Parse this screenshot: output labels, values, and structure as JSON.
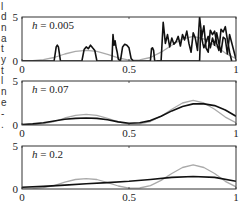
{
  "side_text_fragments": [
    "l",
    "d",
    "n",
    "a",
    "t",
    "y",
    "t",
    "l",
    "n",
    "e",
    "-",
    "."
  ],
  "colors": {
    "estimate": "#111111",
    "true_density": "#aaaaaa",
    "frame": "#333333"
  },
  "chart_data": [
    {
      "type": "line",
      "title": "h = 0.005",
      "annotation": "h = 0.005",
      "xlabel": "",
      "ylabel": "",
      "xlim": [
        0,
        1
      ],
      "ylim": [
        0,
        5
      ],
      "xticks": [
        "0",
        "0.5",
        "1"
      ],
      "yticks": [
        "0",
        "5"
      ],
      "grid": false,
      "series": [
        {
          "name": "true density",
          "color": "#aaaaaa",
          "x": [
            0,
            0.05,
            0.1,
            0.15,
            0.2,
            0.25,
            0.3,
            0.35,
            0.4,
            0.45,
            0.5,
            0.55,
            0.6,
            0.65,
            0.7,
            0.75,
            0.8,
            0.85,
            0.9,
            0.95,
            1.0
          ],
          "y": [
            0.02,
            0.05,
            0.15,
            0.4,
            0.8,
            1.1,
            1.2,
            1.1,
            0.75,
            0.35,
            0.1,
            0.12,
            0.4,
            1.0,
            1.8,
            2.5,
            2.8,
            2.5,
            1.8,
            0.9,
            0.25
          ]
        },
        {
          "name": "kernel estimate",
          "color": "#111111",
          "x": [
            0,
            0.15,
            0.16,
            0.165,
            0.17,
            0.18,
            0.28,
            0.29,
            0.3,
            0.31,
            0.32,
            0.33,
            0.34,
            0.35,
            0.36,
            0.42,
            0.425,
            0.43,
            0.435,
            0.44,
            0.445,
            0.45,
            0.46,
            0.47,
            0.48,
            0.49,
            0.5,
            0.51,
            0.52,
            0.53,
            0.6,
            0.605,
            0.61,
            0.615,
            0.62,
            0.83,
            0.835,
            0.84,
            0.845,
            0.85,
            0.87,
            0.88,
            0.89,
            0.9,
            0.91,
            0.92,
            0.93,
            0.94,
            0.95,
            0.96,
            0.97,
            1.0
          ],
          "y": [
            0,
            0,
            1.6,
            1.8,
            1.6,
            0,
            0,
            1.3,
            1.6,
            1.4,
            1.8,
            1.5,
            1.2,
            0,
            0,
            0,
            3.0,
            1.8,
            2.3,
            1.5,
            1.0,
            0.2,
            0,
            1.6,
            1.9,
            1.8,
            1.5,
            0.3,
            0,
            0,
            0,
            1.4,
            1.5,
            1.2,
            0,
            0,
            3.5,
            2.6,
            2.0,
            1.5,
            2.8,
            1.5,
            2.6,
            1.8,
            3.2,
            2.0,
            1.0,
            2.7,
            2.5,
            0.8,
            3.0,
            0.2
          ]
        },
        {
          "name": "kernel estimate (right)",
          "color": "#111111",
          "x": [
            0.63,
            0.65,
            0.66,
            0.67,
            0.68,
            0.69,
            0.7,
            0.71,
            0.72,
            0.73,
            0.74,
            0.75,
            0.76,
            0.77,
            0.78,
            0.79,
            0.8,
            0.81,
            0.82,
            0.83,
            0.84,
            0.85,
            0.86,
            0.87,
            0.88,
            0.89,
            0.9,
            0.91,
            0.92,
            0.93,
            0.94,
            0.95,
            0.96,
            0.97,
            0.98
          ],
          "y": [
            0,
            0,
            4.4,
            2.0,
            3.0,
            1.6,
            2.6,
            1.9,
            2.2,
            2.8,
            1.7,
            3.0,
            2.4,
            3.4,
            2.0,
            1.0,
            3.2,
            2.6,
            1.2,
            5.0,
            2.8,
            4.0,
            1.5,
            1.0,
            3.5,
            3.0,
            3.4,
            2.0,
            1.2,
            3.6,
            3.3,
            3.9,
            2.4,
            1.0,
            0
          ]
        }
      ]
    },
    {
      "type": "line",
      "title": "h = 0.07",
      "annotation": "h = 0.07",
      "xlabel": "",
      "ylabel": "",
      "xlim": [
        0,
        1
      ],
      "ylim": [
        0,
        5
      ],
      "xticks": [
        "0",
        "0.5",
        "1"
      ],
      "yticks": [
        "0",
        "5"
      ],
      "grid": false,
      "series": [
        {
          "name": "true density",
          "color": "#aaaaaa",
          "x": [
            0,
            0.05,
            0.1,
            0.15,
            0.2,
            0.25,
            0.3,
            0.35,
            0.4,
            0.45,
            0.5,
            0.55,
            0.6,
            0.65,
            0.7,
            0.75,
            0.8,
            0.85,
            0.9,
            0.95,
            1.0
          ],
          "y": [
            0.02,
            0.05,
            0.15,
            0.4,
            0.8,
            1.1,
            1.2,
            1.1,
            0.75,
            0.35,
            0.1,
            0.12,
            0.4,
            1.0,
            1.8,
            2.5,
            2.8,
            2.5,
            1.8,
            0.9,
            0.25
          ]
        },
        {
          "name": "kernel estimate",
          "color": "#111111",
          "x": [
            0,
            0.05,
            0.1,
            0.15,
            0.2,
            0.25,
            0.3,
            0.35,
            0.4,
            0.45,
            0.5,
            0.55,
            0.6,
            0.65,
            0.7,
            0.75,
            0.8,
            0.85,
            0.9,
            0.95,
            1.0
          ],
          "y": [
            0.05,
            0.12,
            0.25,
            0.45,
            0.65,
            0.75,
            0.8,
            0.75,
            0.6,
            0.35,
            0.2,
            0.25,
            0.5,
            1.0,
            1.6,
            2.1,
            2.4,
            2.4,
            2.2,
            1.7,
            1.0
          ]
        }
      ]
    },
    {
      "type": "line",
      "title": "h = 0.2",
      "annotation": "h = 0.2",
      "xlabel": "",
      "ylabel": "",
      "xlim": [
        0,
        1
      ],
      "ylim": [
        0,
        5
      ],
      "xticks": [
        "0",
        "0.5",
        "1"
      ],
      "yticks": [
        "0",
        "5"
      ],
      "grid": false,
      "series": [
        {
          "name": "true density",
          "color": "#aaaaaa",
          "x": [
            0,
            0.05,
            0.1,
            0.15,
            0.2,
            0.25,
            0.3,
            0.35,
            0.4,
            0.45,
            0.5,
            0.55,
            0.6,
            0.65,
            0.7,
            0.75,
            0.8,
            0.85,
            0.9,
            0.95,
            1.0
          ],
          "y": [
            0.02,
            0.05,
            0.15,
            0.4,
            0.8,
            1.1,
            1.2,
            1.1,
            0.75,
            0.35,
            0.1,
            0.12,
            0.4,
            1.0,
            1.8,
            2.5,
            2.8,
            2.5,
            1.8,
            0.9,
            0.25
          ]
        },
        {
          "name": "kernel estimate",
          "color": "#111111",
          "x": [
            0,
            0.1,
            0.2,
            0.3,
            0.4,
            0.5,
            0.6,
            0.7,
            0.8,
            0.9,
            1.0
          ],
          "y": [
            0.2,
            0.3,
            0.45,
            0.6,
            0.75,
            0.9,
            1.1,
            1.35,
            1.45,
            1.35,
            0.9
          ]
        }
      ]
    }
  ]
}
